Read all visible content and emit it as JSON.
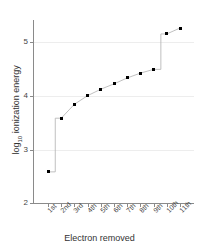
{
  "chart_data": {
    "type": "line",
    "title": "",
    "xlabel": "Electron removed",
    "ylabel": "log10 ionization energy",
    "ylabel_main": "ionization energy",
    "ylabel_prefix": "log",
    "ylabel_sub": "10",
    "categories": [
      "1st",
      "2nd",
      "3rd",
      "4th",
      "5th",
      "6th",
      "7th",
      "8th",
      "9th",
      "10th",
      "11th"
    ],
    "values": [
      2.58,
      3.58,
      3.84,
      4.0,
      4.12,
      4.22,
      4.33,
      4.42,
      4.49,
      5.15,
      5.26
    ],
    "ylim": [
      2,
      5.4
    ],
    "y_ticks": [
      2,
      3,
      4,
      5
    ],
    "y_tick_labels": [
      "2",
      "3",
      "4",
      "5"
    ],
    "grid": true,
    "legend": "none",
    "marker": "square",
    "marker_color": "#000000",
    "line_color": "#b0b0b0",
    "axis_color": "#8a8a8a",
    "grid_color": "#ededed",
    "background": "#ffffff"
  }
}
